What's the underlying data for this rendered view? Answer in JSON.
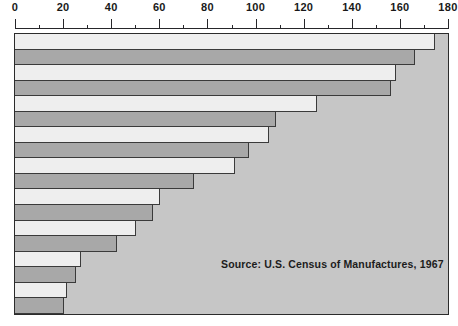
{
  "chart_data": {
    "type": "bar",
    "orientation": "horizontal",
    "title": "",
    "subtitle": "",
    "xlabel": "",
    "ylabel": "",
    "xlim": [
      0,
      180
    ],
    "categories": [
      "1",
      "2",
      "3",
      "4",
      "5",
      "6",
      "7",
      "8",
      "9",
      "10",
      "11",
      "12",
      "13",
      "14",
      "15",
      "16",
      "17",
      "18"
    ],
    "values": [
      174,
      166,
      158,
      156,
      125,
      108,
      105,
      97,
      91,
      74,
      60,
      57,
      50,
      42,
      27,
      25,
      21,
      20
    ],
    "grid": false,
    "legend": "none",
    "axis_position": "top",
    "major_tick_interval": 20,
    "minor_tick_interval": 10,
    "tick_labels": [
      "0",
      "20",
      "40",
      "60",
      "80",
      "100",
      "120",
      "140",
      "160",
      "180"
    ],
    "tick_values": [
      0,
      20,
      40,
      60,
      80,
      100,
      120,
      140,
      160,
      180
    ],
    "minor_tick_values": [
      10,
      30,
      50,
      70,
      90,
      110,
      130,
      150,
      170
    ],
    "bar_colors": [
      "#eeeeee",
      "#a8a8a8"
    ],
    "plot_background": "#c6c6c6",
    "border_color": "#2b2b2b",
    "annotations": [
      {
        "text": "Source:  U.S. Census of Manufactures, 1967",
        "position": "bottom-right"
      }
    ]
  },
  "source_note": "Source:  U.S. Census of Manufactures, 1967"
}
